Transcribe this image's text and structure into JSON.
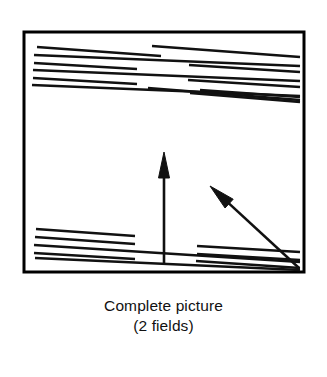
{
  "figure": {
    "caption_line_1": "Complete picture",
    "caption_line_2": "(2 fields)",
    "colors": {
      "ink": "#111111",
      "background": "#ffffff",
      "frame_stroke": "#000000"
    },
    "frame": {
      "label": "picture-frame",
      "x": 24,
      "y": 32,
      "width": 280,
      "height": 240,
      "stroke_width": 3
    },
    "arrows": [
      {
        "name": "vertical-motion-arrow",
        "direction": "up",
        "from_x": 164,
        "from_y": 265,
        "to_x": 164,
        "to_y": 152,
        "stroke_width": 2.6,
        "head_width": 11,
        "head_length": 26
      },
      {
        "name": "diagonal-motion-arrow",
        "direction": "up-left",
        "from_x": 299,
        "from_y": 268,
        "to_x": 210,
        "to_y": 186,
        "stroke_width": 2.6,
        "head_width": 12,
        "head_length": 26
      }
    ],
    "fields": [
      {
        "name": "upper-field-scanlines",
        "count": 12,
        "lines": [
          {
            "x1": 37,
            "y1": 47,
            "x2": 161,
            "y2": 56
          },
          {
            "x1": 152,
            "y1": 46,
            "x2": 300,
            "y2": 57
          },
          {
            "x1": 34,
            "y1": 55,
            "x2": 300,
            "y2": 66
          },
          {
            "x1": 34,
            "y1": 63,
            "x2": 137,
            "y2": 69
          },
          {
            "x1": 189,
            "y1": 65,
            "x2": 300,
            "y2": 72
          },
          {
            "x1": 33,
            "y1": 70,
            "x2": 300,
            "y2": 81
          },
          {
            "x1": 33,
            "y1": 78,
            "x2": 137,
            "y2": 84
          },
          {
            "x1": 188,
            "y1": 80,
            "x2": 300,
            "y2": 87
          },
          {
            "x1": 32,
            "y1": 85,
            "x2": 300,
            "y2": 96
          },
          {
            "x1": 200,
            "y1": 90,
            "x2": 300,
            "y2": 97
          },
          {
            "x1": 148,
            "y1": 88,
            "x2": 300,
            "y2": 100
          },
          {
            "x1": 190,
            "y1": 93,
            "x2": 300,
            "y2": 102
          }
        ]
      },
      {
        "name": "lower-field-scanlines",
        "count": 8,
        "lines": [
          {
            "x1": 36,
            "y1": 229,
            "x2": 135,
            "y2": 236
          },
          {
            "x1": 35,
            "y1": 237,
            "x2": 135,
            "y2": 244
          },
          {
            "x1": 34,
            "y1": 245,
            "x2": 300,
            "y2": 262
          },
          {
            "x1": 34,
            "y1": 253,
            "x2": 135,
            "y2": 259
          },
          {
            "x1": 197,
            "y1": 246,
            "x2": 300,
            "y2": 252
          },
          {
            "x1": 197,
            "y1": 254,
            "x2": 300,
            "y2": 260
          },
          {
            "x1": 35,
            "y1": 258,
            "x2": 300,
            "y2": 270
          },
          {
            "x1": 196,
            "y1": 261,
            "x2": 300,
            "y2": 268
          }
        ]
      }
    ]
  }
}
